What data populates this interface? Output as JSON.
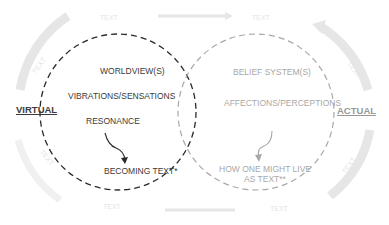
{
  "diagram": {
    "left_circle": {
      "side_label": "VIRTUAL",
      "items": [
        "WORLDVIEW(S)",
        "VIBRATIONS/SENSATIONS",
        "RESONANCE"
      ],
      "result": "BECOMING TEXT*",
      "stroke_color": "#2a2a2a"
    },
    "right_circle": {
      "side_label": "ACTUAL",
      "items": [
        "BELIEF SYSTEM(S)",
        "AFFECTIONS/PERCEPTIONS"
      ],
      "result_line1": "HOW ONE MIGHT LIVE",
      "result_line2": "AS TEXT**",
      "stroke_color": "#a0a0a0"
    },
    "background_labels": [
      "TEXT",
      "TEXT",
      "TEXT",
      "TEXT",
      "TEXT",
      "TEXT",
      "TEXT",
      "TEXT"
    ],
    "background_color": "#e6e6e6"
  }
}
